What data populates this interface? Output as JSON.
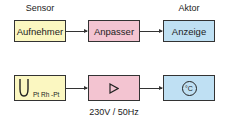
{
  "labels": {
    "sensor": "Sensor",
    "aktor": "Aktor"
  },
  "row1": {
    "box1": "Aufnehmer",
    "box2": "Anpasser",
    "box3": "Anzeige"
  },
  "row2": {
    "box1_icon": "thermocouple-icon",
    "box1_label": "Pt Rh -Pt",
    "box2_icon": "amplifier-triangle-icon",
    "box3_icon": "celsius-icon",
    "box3_symbol": "°C",
    "power_label": "230V / 50Hz"
  },
  "colors": {
    "sensor_fill": "#fbf7c1",
    "adapter_fill": "#f3c4d1",
    "actor_fill": "#bfe0f3",
    "stroke": "#333333"
  }
}
